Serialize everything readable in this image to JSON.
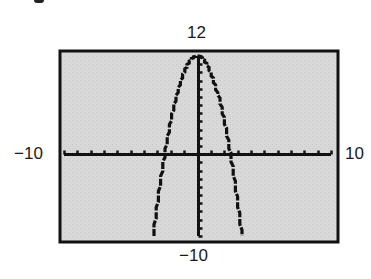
{
  "chart_data": {
    "type": "line",
    "title": "",
    "function": "y = 12 - 2x^2",
    "xlabel": "",
    "ylabel": "",
    "window": {
      "xmin": -10,
      "xmax": 10,
      "ymin": -10,
      "ymax": 12,
      "xscl": 1,
      "yscl": 1
    },
    "xlim": [
      -10,
      10
    ],
    "ylim": [
      -10,
      12
    ],
    "grid": false,
    "legend": null,
    "tick_labels": {
      "xmin": "−10",
      "xmax": "10",
      "ymin": "−10",
      "ymax": "12"
    },
    "series": [
      {
        "name": "y = 12 - 2x^2",
        "x": [
          -3.3,
          -3.0,
          -2.5,
          -2.0,
          -1.5,
          -1.0,
          -0.5,
          0,
          0.5,
          1.0,
          1.5,
          2.0,
          2.5,
          3.0,
          3.3
        ],
        "y": [
          -9.78,
          -6,
          -0.5,
          4,
          7.5,
          10,
          11.5,
          12,
          11.5,
          10,
          7.5,
          4,
          -0.5,
          -6,
          -9.78
        ]
      }
    ],
    "key_points": {
      "vertex": [
        0,
        12
      ],
      "x_intercepts": [
        -2.449,
        2.449
      ],
      "y_intercept": 12
    }
  },
  "colors": {
    "screen_background": "#d6d6d6",
    "frame": "#111111",
    "axis": "#111111",
    "curve": "#111111",
    "label": "#1a1a1a"
  },
  "labels": {
    "ymax": "12",
    "ymin": "−10",
    "xmin": "−10",
    "xmax": "10"
  }
}
